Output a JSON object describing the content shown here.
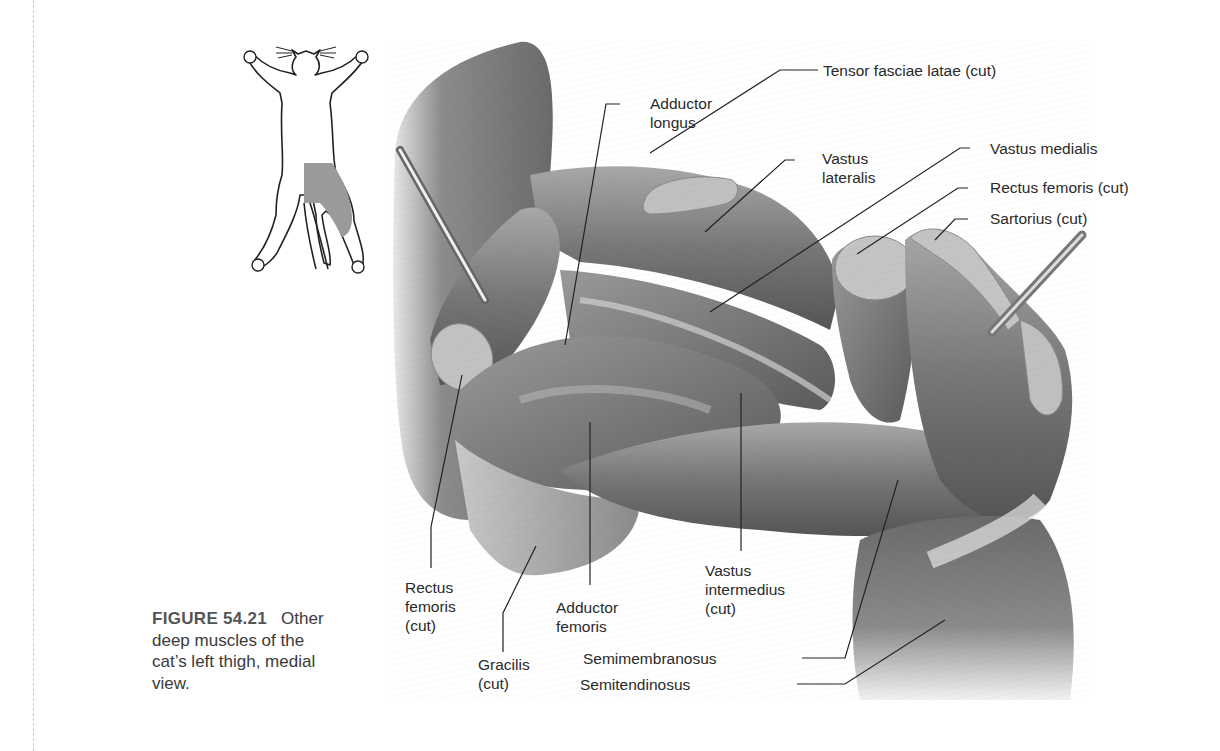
{
  "caption": {
    "figure_number": "FIGURE 54.21",
    "text": "Other deep muscles of the cat’s left thigh, medial view."
  },
  "orientation_thumbnail": {
    "subject": "cat-outline-ventral-view",
    "highlighted_region": "left-thigh",
    "highlight_color": "#9a9a9a"
  },
  "labels": {
    "adductor_longus": "Adductor\nlongus",
    "tensor_fasciae_latae": "Tensor fasciae latae (cut)",
    "vastus_lateralis": "Vastus\nlateralis",
    "vastus_medialis": "Vastus medialis",
    "rectus_femoris_cut_top": "Rectus femoris (cut)",
    "sartorius": "Sartorius (cut)",
    "rectus_femoris_cut_left": "Rectus\nfemoris\n(cut)",
    "gracilis": "Gracilis\n(cut)",
    "adductor_femoris": "Adductor\nfemoris",
    "vastus_intermedius": "Vastus\nintermedius\n(cut)",
    "semimembranosus": "Semimembranosus",
    "semitendinosus": "Semitendinosus"
  },
  "colors": {
    "muscle_dark": "#5e5e5e",
    "muscle_mid": "#8a8a8a",
    "muscle_light": "#b5b5b5",
    "cut_surface": "#c4c4c4",
    "leader_line": "#222222"
  }
}
